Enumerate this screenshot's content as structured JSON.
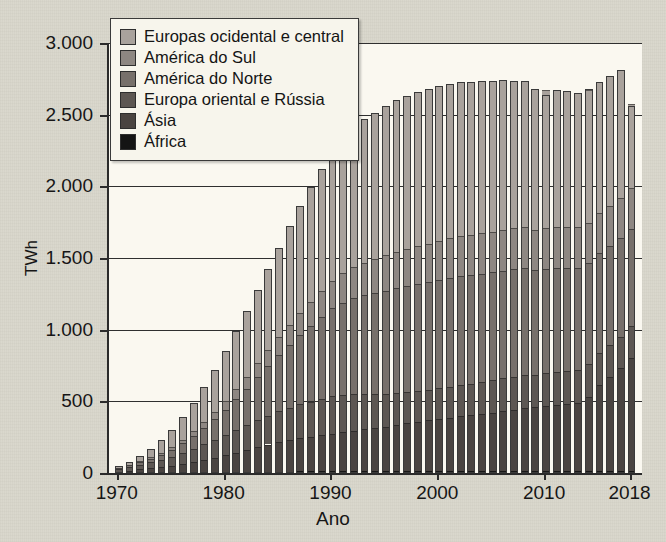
{
  "chart_data": {
    "type": "bar",
    "stacked": true,
    "title": "",
    "xlabel": "Ano",
    "ylabel": "TWh",
    "ylim": [
      0,
      3000
    ],
    "ytick_labels": [
      "0",
      "500",
      "1.000",
      "1.500",
      "2.000",
      "2.500",
      "3.000"
    ],
    "ytick_values": [
      0,
      500,
      1000,
      1500,
      2000,
      2500,
      3000
    ],
    "xtick_labels": [
      "1970",
      "1980",
      "1990",
      "2000",
      "2010",
      "2018"
    ],
    "xtick_values": [
      1970,
      1980,
      1990,
      2000,
      2010,
      2018
    ],
    "grid": true,
    "legend_position": "top-left",
    "x": [
      1970,
      1971,
      1972,
      1973,
      1974,
      1975,
      1976,
      1977,
      1978,
      1979,
      1980,
      1981,
      1982,
      1983,
      1984,
      1985,
      1986,
      1987,
      1988,
      1989,
      1990,
      1991,
      1992,
      1993,
      1994,
      1995,
      1996,
      1997,
      1998,
      1999,
      2000,
      2001,
      2002,
      2003,
      2004,
      2005,
      2006,
      2007,
      2008,
      2009,
      2010,
      2011,
      2012,
      2013,
      2014,
      2015,
      2016,
      2017,
      2018
    ],
    "series": [
      {
        "name": "África",
        "color": "#141414",
        "values": [
          2,
          3,
          3,
          4,
          4,
          5,
          5,
          6,
          6,
          7,
          7,
          8,
          8,
          9,
          9,
          10,
          10,
          11,
          11,
          12,
          12,
          12,
          12,
          12,
          12,
          12,
          12,
          12,
          12,
          12,
          12,
          12,
          12,
          12,
          12,
          12,
          12,
          12,
          12,
          12,
          12,
          12,
          12,
          12,
          12,
          12,
          12,
          12,
          12
        ]
      },
      {
        "name": "Ásia",
        "color": "#4a4441",
        "values": [
          8,
          14,
          22,
          30,
          38,
          46,
          58,
          72,
          86,
          100,
          116,
          134,
          152,
          172,
          190,
          205,
          218,
          230,
          240,
          250,
          262,
          272,
          282,
          292,
          300,
          312,
          322,
          335,
          345,
          355,
          365,
          375,
          385,
          392,
          400,
          410,
          420,
          430,
          440,
          450,
          455,
          465,
          472,
          478,
          520,
          600,
          660,
          720,
          790
        ]
      },
      {
        "name": "Europa oriental e Rússia",
        "color": "#5d5753",
        "values": [
          18,
          26,
          34,
          42,
          52,
          64,
          78,
          92,
          108,
          124,
          140,
          156,
          172,
          188,
          202,
          215,
          228,
          238,
          248,
          256,
          262,
          262,
          256,
          246,
          236,
          228,
          222,
          216,
          212,
          212,
          214,
          216,
          218,
          220,
          222,
          224,
          228,
          230,
          232,
          222,
          228,
          230,
          230,
          228,
          226,
          222,
          220,
          220,
          222
        ]
      },
      {
        "name": "América do Norte",
        "color": "#77706b",
        "values": [
          6,
          10,
          16,
          24,
          34,
          48,
          66,
          88,
          114,
          144,
          178,
          216,
          256,
          300,
          344,
          392,
          440,
          486,
          530,
          572,
          612,
          642,
          668,
          690,
          706,
          720,
          732,
          742,
          748,
          752,
          756,
          758,
          760,
          758,
          756,
          754,
          752,
          748,
          744,
          730,
          726,
          722,
          716,
          710,
          704,
          698,
          692,
          686,
          680
        ]
      },
      {
        "name": "América do Sul",
        "color": "#8e8782",
        "values": [
          3,
          5,
          8,
          11,
          15,
          20,
          26,
          33,
          41,
          50,
          60,
          71,
          83,
          96,
          110,
          124,
          138,
          152,
          166,
          180,
          194,
          206,
          218,
          228,
          238,
          246,
          254,
          260,
          266,
          270,
          274,
          276,
          278,
          280,
          282,
          284,
          286,
          288,
          290,
          284,
          286,
          288,
          288,
          286,
          284,
          282,
          280,
          280,
          282
        ]
      },
      {
        "name": "Europas ocidental e central",
        "color": "#a9a29c",
        "values": [
          13,
          22,
          37,
          59,
          87,
          117,
          157,
          199,
          245,
          295,
          349,
          405,
          459,
          514,
          566,
          624,
          686,
          743,
          798,
          850,
          898,
          938,
          972,
          1000,
          1020,
          1042,
          1058,
          1068,
          1074,
          1078,
          1080,
          1078,
          1076,
          1068,
          1060,
          1052,
          1044,
          1030,
          1016,
          984,
          968,
          956,
          944,
          934,
          926,
          916,
          904,
          894,
          586
        ]
      }
    ],
    "totals": [
      50,
      80,
      120,
      170,
      230,
      300,
      390,
      490,
      600,
      720,
      850,
      990,
      1130,
      1279,
      1421,
      1570,
      1720,
      1860,
      1993,
      2120,
      2240,
      2332,
      2408,
      2468,
      2512,
      2560,
      2600,
      2633,
      2657,
      2679,
      2701,
      2715,
      2729,
      2730,
      2732,
      2736,
      2742,
      2738,
      2734,
      2682,
      2635,
      2673,
      2662,
      2648,
      2682,
      2730,
      2768,
      2812,
      2560
    ]
  },
  "legend": {
    "items": [
      {
        "label": "Europas ocidental e central",
        "color": "#a9a29c"
      },
      {
        "label": "América do Sul",
        "color": "#8e8782"
      },
      {
        "label": "América do Norte",
        "color": "#77706b"
      },
      {
        "label": "Europa oriental e Rússia",
        "color": "#5d5753"
      },
      {
        "label": "Ásia",
        "color": "#4a4441"
      },
      {
        "label": "África",
        "color": "#141414"
      }
    ]
  },
  "theme": {
    "page_background": "#d9d7cc",
    "plot_background": "#faf8f0",
    "axis_color": "#2b2b2b",
    "grid_color": "#2f2f2f",
    "text_color": "#161616"
  }
}
